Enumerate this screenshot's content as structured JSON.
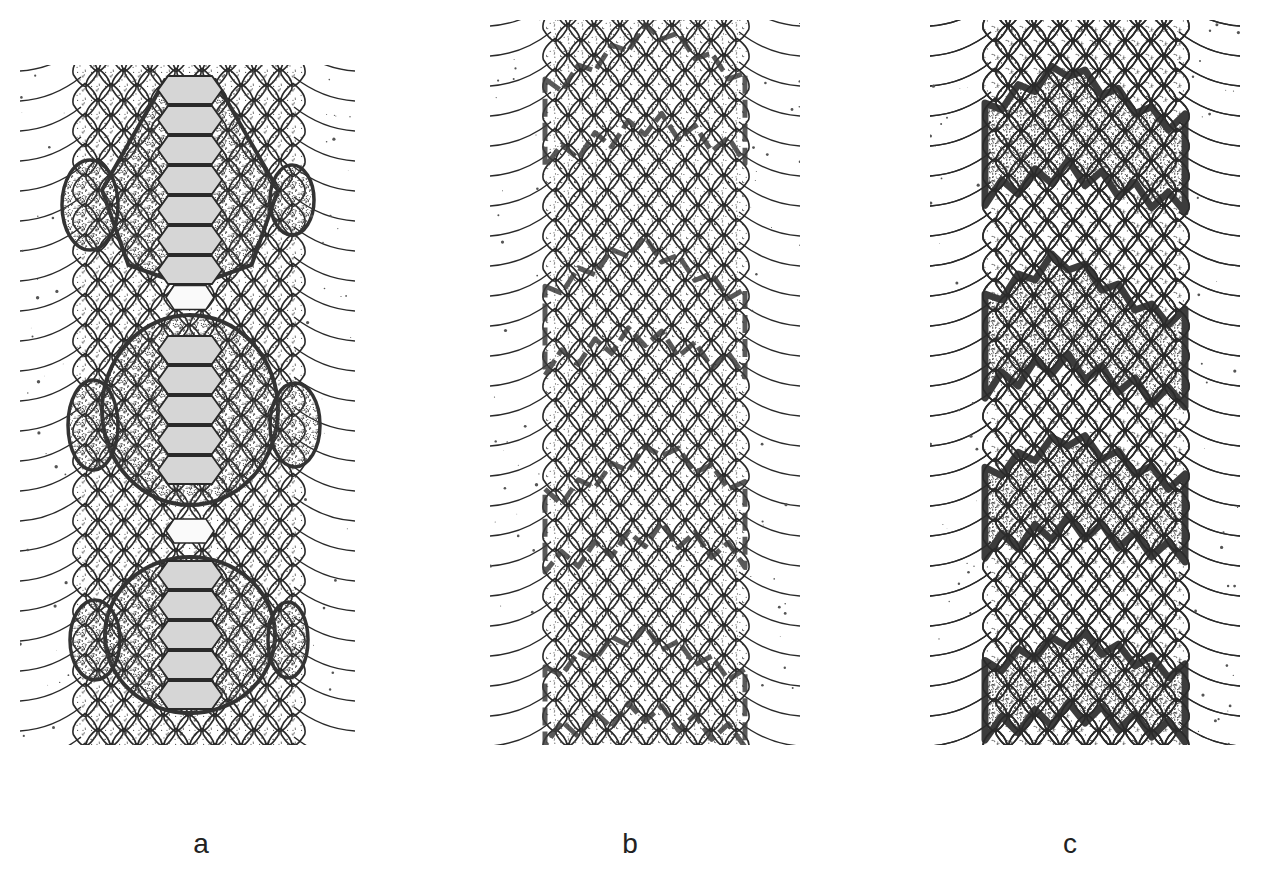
{
  "figure": {
    "panels": [
      {
        "id": "a",
        "label": "a",
        "label_x": 201,
        "x": 20,
        "y": 55,
        "width": 335,
        "height": 700,
        "pattern": "large hexagonal dorsal blotches with lateral side blotches",
        "blotches": [
          {
            "cx": 170,
            "cy": 125,
            "rx": 88,
            "ry": 100,
            "shape": "hex"
          },
          {
            "cx": 170,
            "cy": 355,
            "rx": 88,
            "ry": 95,
            "shape": "round"
          },
          {
            "cx": 170,
            "cy": 580,
            "rx": 85,
            "ry": 78,
            "shape": "round"
          }
        ],
        "side_blotches": [
          {
            "cx": 70,
            "cy": 150,
            "rx": 28,
            "ry": 45
          },
          {
            "cx": 272,
            "cy": 145,
            "rx": 22,
            "ry": 35
          },
          {
            "cx": 73,
            "cy": 370,
            "rx": 25,
            "ry": 45
          },
          {
            "cx": 275,
            "cy": 370,
            "rx": 25,
            "ry": 42
          },
          {
            "cx": 75,
            "cy": 585,
            "rx": 25,
            "ry": 40
          },
          {
            "cx": 268,
            "cy": 585,
            "rx": 20,
            "ry": 38
          }
        ]
      },
      {
        "id": "b",
        "label": "b",
        "label_x": 630,
        "x": 490,
        "y": 10,
        "width": 310,
        "height": 745,
        "pattern": "faded crossbands with dark irregular margins",
        "bands": [
          {
            "cy": 75,
            "amp": 60,
            "thick": 70,
            "peak": 165
          },
          {
            "cy": 285,
            "amp": 55,
            "thick": 70,
            "peak": 150
          },
          {
            "cy": 485,
            "amp": 50,
            "thick": 65,
            "peak": 170
          },
          {
            "cy": 665,
            "amp": 45,
            "thick": 60,
            "peak": 150
          }
        ]
      },
      {
        "id": "c",
        "label": "c",
        "label_x": 1070,
        "x": 930,
        "y": 10,
        "width": 310,
        "height": 745,
        "pattern": "zig-zag dark-bordered crossbands",
        "bands": [
          {
            "cy": 110,
            "amp": 55,
            "thick": 80,
            "peak": 135
          },
          {
            "cy": 305,
            "amp": 60,
            "thick": 80,
            "peak": 130
          },
          {
            "cy": 470,
            "amp": 45,
            "thick": 70,
            "peak": 140
          },
          {
            "cy": 660,
            "amp": 35,
            "thick": 60,
            "peak": 145
          }
        ]
      }
    ]
  },
  "colors": {
    "background": "#ffffff",
    "line": "#2a2a2a",
    "scale_fill": "#f1f1f1",
    "blotch_fill": "#c9c9c9",
    "blotch_border": "#333333",
    "band_dark": "#3c3c3c",
    "label": "#222222"
  }
}
